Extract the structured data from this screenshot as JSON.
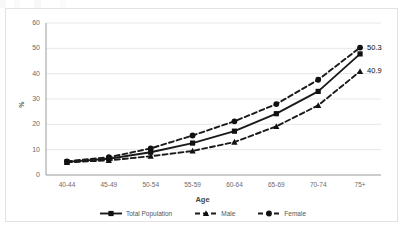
{
  "chart_data": {
    "type": "line",
    "title": "",
    "xlabel": "Age",
    "ylabel": "%",
    "categories": [
      "40-44",
      "45-49",
      "50-54",
      "55-59",
      "60-64",
      "65-69",
      "70-74",
      "75+"
    ],
    "ylim": [
      0,
      60
    ],
    "ytick_step": 10,
    "yticks": [
      "0",
      "10",
      "20",
      "30",
      "40",
      "50",
      "60"
    ],
    "grid": "horizontal",
    "legend_position": "bottom",
    "series": [
      {
        "name": "Total Population",
        "line_style": "solid",
        "marker": "square",
        "color": "#1a1a1a",
        "values": [
          5.2,
          6.4,
          9.0,
          12.6,
          17.3,
          24.2,
          33.0,
          47.8
        ]
      },
      {
        "name": "Male",
        "line_style": "dashed",
        "marker": "triangle",
        "color": "#1a1a1a",
        "values": [
          5.0,
          5.8,
          7.4,
          9.5,
          13.0,
          19.2,
          27.5,
          40.9
        ]
      },
      {
        "name": "Female",
        "line_style": "dashed",
        "marker": "circle",
        "color": "#1a1a1a",
        "values": [
          5.4,
          7.0,
          10.5,
          15.6,
          21.2,
          28.0,
          37.6,
          50.3
        ]
      }
    ],
    "annotations": [
      {
        "label": "50.3",
        "series": "Female",
        "category": "75+"
      },
      {
        "label": "40.9",
        "series": "Male",
        "category": "75+"
      }
    ]
  }
}
